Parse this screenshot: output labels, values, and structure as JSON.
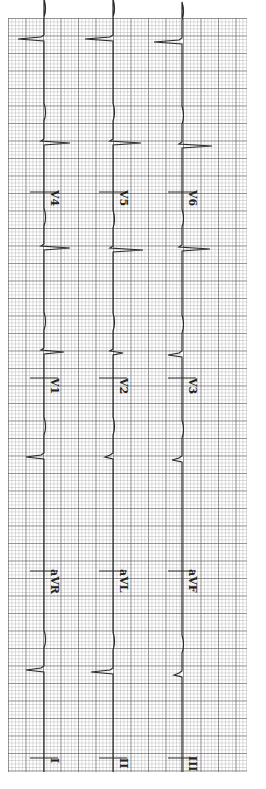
{
  "ecg": {
    "orientation": "rotated-90-clockwise",
    "grid_color": "#8c8c8c",
    "trace_color": "#2a2a2a",
    "rows": [
      {
        "x": 44,
        "labels": [
          "I",
          "aVR",
          "V1",
          "V4"
        ]
      },
      {
        "x": 113,
        "labels": [
          "II",
          "aVL",
          "V2",
          "V5"
        ]
      },
      {
        "x": 182,
        "labels": [
          "III",
          "aVF",
          "V3",
          "V6"
        ]
      }
    ],
    "label_positions_y": [
      762,
      575,
      382,
      196
    ],
    "beats_y": [
      [
        39,
        143,
        248,
        352,
        457,
        670
      ],
      [
        39,
        143,
        250,
        353,
        457,
        672
      ],
      [
        42,
        146,
        249,
        355,
        460,
        675
      ]
    ],
    "spike_len": [
      [
        -26,
        26,
        26,
        20,
        -18,
        -18
      ],
      [
        -28,
        28,
        30,
        10,
        -8,
        -22
      ],
      [
        -28,
        30,
        28,
        -14,
        -10,
        -8
      ]
    ]
  },
  "labels": {
    "r1c1": "I",
    "r1c2": "aVR",
    "r1c3": "V1",
    "r1c4": "V4",
    "r2c1": "II",
    "r2c2": "aVL",
    "r2c3": "V2",
    "r2c4": "V5",
    "r3c1": "III",
    "r3c2": "aVF",
    "r3c3": "V3",
    "r3c4": "V6"
  }
}
